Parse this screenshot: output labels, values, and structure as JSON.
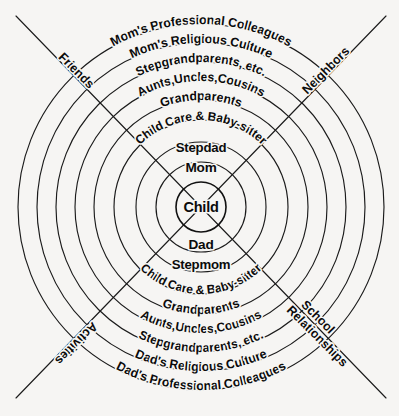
{
  "diagram": {
    "type": "concentric-rings",
    "background_color": "#f6f5f3",
    "line_color": "#1b1b1b",
    "text_color": "#0b0b0b",
    "center": {
      "x": 201,
      "y": 207
    },
    "core": {
      "center_label": "Child",
      "center_radius": 25,
      "upper_inner_label": "Mom",
      "lower_inner_label": "Dad",
      "upper_outer_label": "Stepdad",
      "lower_outer_label": "Stepmom",
      "inner_ring_radius": 45,
      "outer_ring_radius": 65
    },
    "rings": [
      {
        "index": 1,
        "radius": 25,
        "top_label": "",
        "bottom_label": ""
      },
      {
        "index": 2,
        "radius": 45,
        "top_label": "Mom",
        "bottom_label": "Dad"
      },
      {
        "index": 3,
        "radius": 65,
        "top_label": "Stepdad",
        "bottom_label": "Stepmom"
      },
      {
        "index": 4,
        "radius": 87,
        "top_label": "Child Care & Baby-sitter",
        "bottom_label": "Child Care & Baby-sitter"
      },
      {
        "index": 5,
        "radius": 107,
        "top_label": "Grandparents",
        "bottom_label": "Grandparents"
      },
      {
        "index": 6,
        "radius": 126,
        "top_label": "Aunts,Uncles,Cousins",
        "bottom_label": "Aunts,Uncles,Cousins"
      },
      {
        "index": 7,
        "radius": 145,
        "top_label": "Stepgrandparents, etc.",
        "bottom_label": "Stepgrandparents, etc."
      },
      {
        "index": 8,
        "radius": 164,
        "top_label": "Mom's Religious Culture",
        "bottom_label": "Dad's Religious Culture"
      },
      {
        "index": 9,
        "radius": 183,
        "top_label": "Mom's Professional Colleagues",
        "bottom_label": "Dad's Professional Colleagues"
      }
    ],
    "corners": {
      "top_left": "Friends",
      "top_right": "Neighbors",
      "bottom_left": "Activities",
      "bottom_right_line_1": "School",
      "bottom_right_line_2": "Relationships"
    }
  }
}
